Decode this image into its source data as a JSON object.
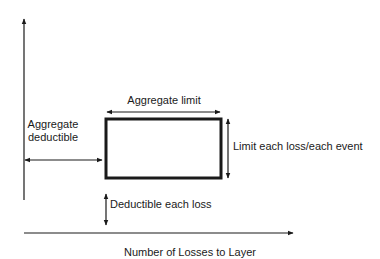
{
  "diagram": {
    "type": "excess-of-loss layer schematic",
    "colors": {
      "line": "#1a1a1a",
      "background": "#ffffff"
    },
    "x_axis": {
      "label": "Number of Losses to Layer"
    },
    "y_axis": {
      "label": ""
    },
    "layer_box": {
      "name": "reinsurance layer"
    },
    "annotations": {
      "aggregate_limit": "Aggregate limit",
      "limit_each_loss": "Limit each loss/each event",
      "aggregate_deductible_line1": "Aggregate",
      "aggregate_deductible_line2": "deductible",
      "deductible_each_loss": "Deductible each loss"
    }
  }
}
